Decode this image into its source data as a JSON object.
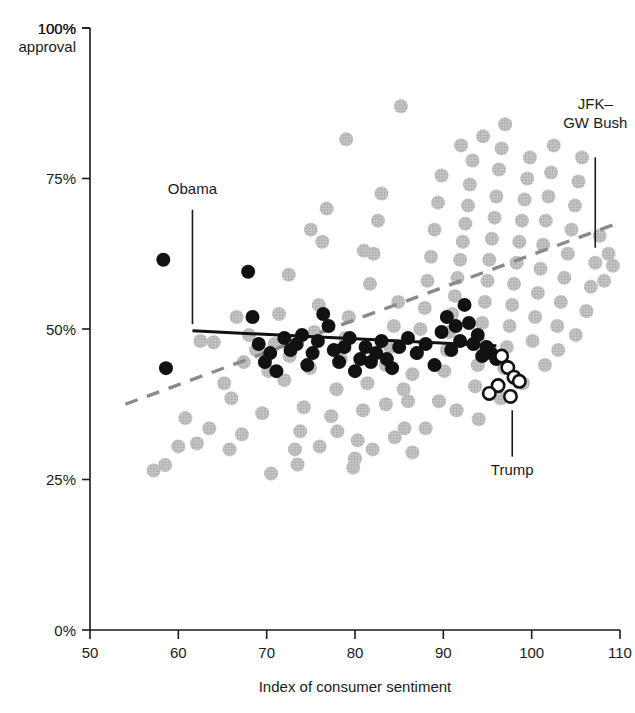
{
  "chart_data": {
    "type": "scatter",
    "title": "",
    "subtitle": "",
    "xlabel": "Index of consumer sentiment",
    "ylabel": "100% approval",
    "ylabel_line1": "100%",
    "ylabel_line2": "approval",
    "xlim": [
      50,
      110
    ],
    "ylim": [
      0,
      100
    ],
    "xticks": [
      50,
      60,
      70,
      80,
      90,
      100,
      110
    ],
    "xticklabels": [
      "50",
      "60",
      "70",
      "80",
      "90",
      "100",
      "110"
    ],
    "yticks": [
      0,
      25,
      50,
      75,
      100
    ],
    "yticklabels": [
      "0%",
      "25%",
      "50%",
      "75%",
      "100%"
    ],
    "grid": false,
    "legend_position": "none",
    "colors": {
      "other_presidents": "#b9b9b9",
      "obama": "#111111",
      "trump_fill": "#ffffff",
      "trump_stroke": "#111111",
      "obama_trendline": "#111111",
      "other_trendline": "#8a8a8a",
      "axis": "#1a1a1a"
    },
    "series": [
      {
        "name": "JFK–GW Bush",
        "marker": "filled-circle",
        "color": "#b9b9b9",
        "points": [
          [
            57.2,
            26.5
          ],
          [
            58.5,
            27.4
          ],
          [
            60.0,
            30.5
          ],
          [
            60.8,
            35.2
          ],
          [
            62.1,
            31.0
          ],
          [
            63.5,
            33.5
          ],
          [
            64.0,
            47.8
          ],
          [
            65.2,
            41.0
          ],
          [
            66.0,
            38.5
          ],
          [
            66.6,
            52.0
          ],
          [
            67.4,
            44.5
          ],
          [
            68.0,
            49.0
          ],
          [
            68.8,
            46.5
          ],
          [
            69.5,
            36.0
          ],
          [
            70.2,
            43.0
          ],
          [
            70.9,
            47.5
          ],
          [
            71.4,
            52.5
          ],
          [
            72.0,
            41.5
          ],
          [
            72.6,
            45.5
          ],
          [
            73.2,
            30.0
          ],
          [
            73.8,
            33.0
          ],
          [
            74.2,
            37.0
          ],
          [
            74.9,
            43.5
          ],
          [
            75.4,
            49.5
          ],
          [
            75.9,
            54.0
          ],
          [
            76.3,
            64.5
          ],
          [
            76.8,
            70.0
          ],
          [
            77.3,
            35.5
          ],
          [
            77.9,
            40.0
          ],
          [
            78.4,
            45.0
          ],
          [
            78.9,
            48.5
          ],
          [
            79.3,
            52.0
          ],
          [
            79.8,
            27.0
          ],
          [
            80.3,
            31.5
          ],
          [
            80.9,
            36.5
          ],
          [
            81.4,
            41.0
          ],
          [
            81.7,
            57.5
          ],
          [
            82.1,
            62.5
          ],
          [
            82.6,
            68.0
          ],
          [
            83.0,
            72.5
          ],
          [
            83.5,
            44.0
          ],
          [
            84.0,
            47.0
          ],
          [
            84.4,
            50.5
          ],
          [
            84.9,
            54.5
          ],
          [
            85.2,
            87.0
          ],
          [
            85.6,
            33.5
          ],
          [
            86.0,
            38.0
          ],
          [
            86.5,
            42.5
          ],
          [
            87.0,
            46.0
          ],
          [
            87.4,
            50.0
          ],
          [
            87.9,
            53.5
          ],
          [
            88.2,
            58.0
          ],
          [
            88.6,
            62.0
          ],
          [
            89.0,
            66.5
          ],
          [
            89.4,
            71.0
          ],
          [
            89.8,
            75.5
          ],
          [
            90.1,
            43.0
          ],
          [
            90.4,
            46.5
          ],
          [
            90.7,
            49.5
          ],
          [
            91.0,
            52.5
          ],
          [
            91.3,
            55.5
          ],
          [
            91.6,
            58.5
          ],
          [
            91.9,
            61.5
          ],
          [
            92.2,
            64.5
          ],
          [
            92.5,
            67.5
          ],
          [
            92.8,
            70.5
          ],
          [
            93.0,
            74.0
          ],
          [
            93.3,
            78.0
          ],
          [
            93.6,
            40.5
          ],
          [
            93.9,
            44.0
          ],
          [
            94.1,
            47.5
          ],
          [
            94.4,
            51.0
          ],
          [
            94.7,
            54.5
          ],
          [
            95.0,
            58.0
          ],
          [
            95.2,
            61.5
          ],
          [
            95.5,
            65.0
          ],
          [
            95.8,
            68.5
          ],
          [
            96.0,
            72.0
          ],
          [
            96.3,
            76.5
          ],
          [
            96.6,
            80.0
          ],
          [
            96.9,
            43.5
          ],
          [
            97.2,
            47.0
          ],
          [
            97.5,
            50.5
          ],
          [
            97.8,
            54.0
          ],
          [
            98.0,
            57.5
          ],
          [
            98.3,
            61.0
          ],
          [
            98.6,
            64.5
          ],
          [
            98.9,
            68.0
          ],
          [
            99.2,
            71.5
          ],
          [
            99.5,
            75.0
          ],
          [
            99.8,
            78.5
          ],
          [
            100.1,
            48.0
          ],
          [
            100.4,
            52.0
          ],
          [
            100.7,
            56.0
          ],
          [
            101.0,
            60.0
          ],
          [
            101.3,
            64.0
          ],
          [
            101.6,
            68.0
          ],
          [
            101.9,
            72.0
          ],
          [
            102.2,
            76.0
          ],
          [
            102.5,
            80.5
          ],
          [
            102.9,
            50.5
          ],
          [
            103.3,
            54.5
          ],
          [
            103.7,
            58.5
          ],
          [
            104.1,
            62.5
          ],
          [
            104.5,
            66.5
          ],
          [
            104.9,
            70.5
          ],
          [
            105.3,
            74.5
          ],
          [
            105.7,
            78.5
          ],
          [
            106.2,
            53.0
          ],
          [
            106.7,
            57.0
          ],
          [
            107.2,
            61.0
          ],
          [
            107.7,
            65.5
          ],
          [
            108.2,
            58.0
          ],
          [
            108.7,
            62.5
          ],
          [
            109.2,
            60.5
          ],
          [
            62.5,
            48.0
          ],
          [
            65.8,
            30.0
          ],
          [
            67.2,
            32.5
          ],
          [
            70.5,
            26.0
          ],
          [
            73.5,
            27.5
          ],
          [
            76.0,
            30.5
          ],
          [
            78.0,
            33.0
          ],
          [
            80.0,
            28.5
          ],
          [
            82.0,
            30.0
          ],
          [
            84.5,
            32.0
          ],
          [
            86.5,
            29.5
          ],
          [
            88.0,
            33.5
          ],
          [
            72.5,
            59.0
          ],
          [
            75.0,
            66.5
          ],
          [
            79.0,
            81.5
          ],
          [
            81.0,
            63.0
          ],
          [
            83.5,
            37.5
          ],
          [
            85.5,
            40.0
          ],
          [
            89.5,
            38.0
          ],
          [
            91.5,
            36.5
          ],
          [
            94.0,
            35.0
          ],
          [
            96.5,
            38.5
          ],
          [
            99.0,
            41.0
          ],
          [
            101.5,
            44.0
          ],
          [
            103.0,
            46.5
          ],
          [
            105.0,
            49.0
          ],
          [
            92.0,
            80.5
          ],
          [
            94.5,
            82.0
          ],
          [
            97.0,
            84.0
          ]
        ]
      },
      {
        "name": "Obama",
        "marker": "filled-circle",
        "color": "#111111",
        "points": [
          [
            58.3,
            61.5
          ],
          [
            58.6,
            43.5
          ],
          [
            67.9,
            59.5
          ],
          [
            68.4,
            52.0
          ],
          [
            69.1,
            47.5
          ],
          [
            69.8,
            44.5
          ],
          [
            70.4,
            46.0
          ],
          [
            71.1,
            43.0
          ],
          [
            72.0,
            48.5
          ],
          [
            72.7,
            46.5
          ],
          [
            73.4,
            47.5
          ],
          [
            74.0,
            49.0
          ],
          [
            74.6,
            44.0
          ],
          [
            75.2,
            46.0
          ],
          [
            75.8,
            48.0
          ],
          [
            76.4,
            52.5
          ],
          [
            77.0,
            50.5
          ],
          [
            77.6,
            46.5
          ],
          [
            78.2,
            44.5
          ],
          [
            78.8,
            47.0
          ],
          [
            79.4,
            48.5
          ],
          [
            80.0,
            43.0
          ],
          [
            80.6,
            45.0
          ],
          [
            81.2,
            47.0
          ],
          [
            81.8,
            44.5
          ],
          [
            82.4,
            46.0
          ],
          [
            83.0,
            48.0
          ],
          [
            83.6,
            45.0
          ],
          [
            84.2,
            43.5
          ],
          [
            85.0,
            47.0
          ],
          [
            86.0,
            48.5
          ],
          [
            87.0,
            46.0
          ],
          [
            88.0,
            47.5
          ],
          [
            89.0,
            44.0
          ],
          [
            89.8,
            49.5
          ],
          [
            90.4,
            52.0
          ],
          [
            90.9,
            46.5
          ],
          [
            91.4,
            50.5
          ],
          [
            91.9,
            48.0
          ],
          [
            92.4,
            54.0
          ],
          [
            92.9,
            51.0
          ],
          [
            93.4,
            47.5
          ],
          [
            93.9,
            49.0
          ],
          [
            94.4,
            45.5
          ],
          [
            94.9,
            47.0
          ],
          [
            95.4,
            46.0
          ],
          [
            96.0,
            45.0
          ]
        ]
      },
      {
        "name": "Trump",
        "marker": "open-circle",
        "color": "#ffffff",
        "stroke": "#111111",
        "points": [
          [
            96.6,
            45.5
          ],
          [
            97.3,
            43.6
          ],
          [
            98.0,
            42.0
          ],
          [
            96.2,
            40.6
          ],
          [
            98.6,
            41.3
          ],
          [
            95.2,
            39.3
          ],
          [
            97.6,
            38.8
          ]
        ]
      }
    ],
    "trendlines": [
      {
        "name": "Obama trendline",
        "style": "solid",
        "color": "#111111",
        "x_start": 61.6,
        "y_start": 49.7,
        "x_end": 96.0,
        "y_end": 47.2
      },
      {
        "name": "JFK–GW Bush trendline",
        "style": "dashed",
        "color": "#8a8a8a",
        "x_start": 54.0,
        "y_start": 37.5,
        "x_end": 109.6,
        "y_end": 67.5
      }
    ],
    "annotations": [
      {
        "id": "obama",
        "label": "Obama",
        "label_lines": [
          "Obama"
        ],
        "text_x": 61.6,
        "text_y": 72.5,
        "leader_x": 61.6,
        "leader_y_top": 69.8,
        "leader_y_bottom": 50.8,
        "align": "middle"
      },
      {
        "id": "jfk-gw-bush",
        "label": "JFK–GW Bush",
        "label_lines": [
          "JFK–",
          "GW Bush"
        ],
        "text_x": 107.2,
        "text_y": 86.5,
        "leader_x": 107.2,
        "leader_y_top": 78.5,
        "leader_y_bottom": 63.5,
        "align": "middle"
      },
      {
        "id": "trump",
        "label": "Trump",
        "label_lines": [
          "Trump"
        ],
        "text_x": 97.8,
        "text_y": 25.8,
        "leader_x": 97.8,
        "leader_y_top": 36.5,
        "leader_y_bottom": 28.8,
        "align": "middle"
      }
    ]
  }
}
